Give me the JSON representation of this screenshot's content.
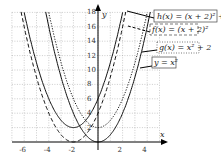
{
  "chart_data": {
    "type": "line",
    "title": "",
    "xlabel": "x",
    "ylabel": "y",
    "xlim": [
      -7,
      5
    ],
    "ylim": [
      0,
      18
    ],
    "grid": true,
    "x_ticks": [
      "-6",
      "-4",
      "-2",
      "2",
      "4"
    ],
    "y_ticks": [
      "2",
      "4",
      "6",
      "8",
      "10",
      "12",
      "14",
      "16",
      "18"
    ],
    "series": [
      {
        "name": "h(x) = (x + 2)² + 2",
        "formula": "(x+2)^2+2",
        "style": "solid"
      },
      {
        "name": "f(x) = (x + 2)²",
        "formula": "(x+2)^2",
        "style": "dashed"
      },
      {
        "name": "g(x) = x² + 2",
        "formula": "x^2+2",
        "style": "dotted"
      },
      {
        "name": "y = x²",
        "formula": "x^2",
        "style": "solid"
      }
    ]
  },
  "labels": {
    "h": "h(x) = (x + 2)² + 2",
    "f": "f(x) = (x + 2)²",
    "g": "g(x) = x² + 2",
    "y": "y = x²",
    "xaxis": "x",
    "yaxis": "y"
  }
}
